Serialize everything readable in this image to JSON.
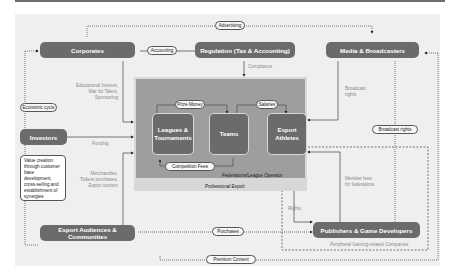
{
  "nodes": {
    "corporates": "Corporates",
    "regulation": "Regulation (Tax & Accounting)",
    "media": "Media & Broadcasters",
    "investors": "Investors",
    "audiences": "Esport Audiences & Communities",
    "publishers": "Publishers & Game Developers"
  },
  "inner_nodes": {
    "leagues": "Leagues & Tournaments",
    "teams": "Teams",
    "athletes": "Esport Athletes"
  },
  "pills": {
    "advertising": "Advertising",
    "accounting": "Accounting",
    "economic_cycle": "Economic cycle",
    "prize_money": "Prize Money",
    "salaries": "Salaries",
    "competition_fees": "Competition Fees",
    "broadcast_rights": "Broadcast rights",
    "purchases": "Purchases",
    "premium_content": "Premium Content"
  },
  "labels": {
    "compliance": "Compliance",
    "corporate_flow": [
      "Educational Interest,",
      "War for Talent,",
      "Sponsoring"
    ],
    "funding": "Funding",
    "audience_flow": [
      "Merchandise,",
      "Tickets purchases,",
      "Esport tourism"
    ],
    "broadcast_flow": [
      "Broadcast",
      "rights"
    ],
    "member_fees": [
      "Member fees",
      "for federations"
    ],
    "rights": "Rights",
    "federations": "Federations/League Operator",
    "professional_esport": "Professional Esport",
    "peripheral": "Peripheral Gaming-related Companies"
  },
  "note": "Value creation through customer base development, cross-selling and establishment of synergies",
  "colors": {
    "node": "#6b6b6b",
    "canvas": "#efefef",
    "professional_outer": "#d8d8d8",
    "professional_inner": "#9e9e9e"
  }
}
